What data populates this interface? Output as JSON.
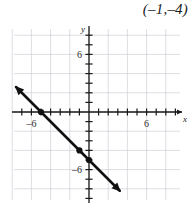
{
  "answer": {
    "text": "(–1,–4)"
  },
  "chart_data": {
    "type": "line",
    "title": "",
    "xlabel": "x",
    "ylabel": "y",
    "xlim": [
      -9,
      9
    ],
    "ylim": [
      -9,
      9
    ],
    "grid": true,
    "grid_step": 2,
    "tick_step": 1,
    "legend": "none",
    "x_tick_labels": [
      {
        "value": -6,
        "label": "–6"
      },
      {
        "value": 6,
        "label": "6"
      }
    ],
    "y_tick_labels": [
      {
        "value": 6,
        "label": "6"
      },
      {
        "value": -6,
        "label": "–6"
      }
    ],
    "series": [
      {
        "name": "line",
        "equation": "y = -x - 5",
        "slope": -1,
        "intercept": -5,
        "endpoints": [
          {
            "x": -7.6,
            "y": 2.6
          },
          {
            "x": 3.2,
            "y": -8.2
          }
        ],
        "arrows": [
          "start",
          "end"
        ]
      }
    ],
    "points": [
      {
        "x": -5,
        "y": 0,
        "marker": "filled-circle"
      },
      {
        "x": -1,
        "y": -4,
        "marker": "filled-circle"
      },
      {
        "x": 0,
        "y": -5,
        "marker": "filled-circle"
      }
    ]
  },
  "labels": {
    "x_axis_name": "x",
    "y_axis_name": "y"
  }
}
